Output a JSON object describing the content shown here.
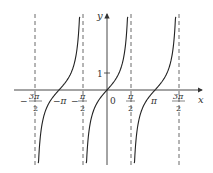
{
  "chart_data": {
    "type": "line",
    "title": "",
    "function": "y = tan x",
    "xlabel": "x",
    "ylabel": "y",
    "x_ticks": [
      {
        "value": -4.712,
        "label_num": "3π",
        "label_den": "2",
        "sign": "−"
      },
      {
        "value": -3.1416,
        "label": "−π"
      },
      {
        "value": -1.5708,
        "label_num": "π",
        "label_den": "2",
        "sign": "−"
      },
      {
        "value": 0,
        "label": "0"
      },
      {
        "value": 1.5708,
        "label_num": "π",
        "label_den": "2",
        "sign": ""
      },
      {
        "value": 3.1416,
        "label": "π"
      },
      {
        "value": 4.712,
        "label_num": "3π",
        "label_den": "2",
        "sign": ""
      }
    ],
    "y_ticks": [
      {
        "value": 1,
        "label": "1"
      }
    ],
    "asymptotes": [
      -4.712,
      -1.5708,
      1.5708,
      4.712
    ],
    "asymptote_style": "dashed",
    "branches": [
      {
        "center": -3.1416,
        "x_range": [
          -4.5,
          -1.78
        ]
      },
      {
        "center": 0,
        "x_range": [
          -1.36,
          1.36
        ]
      },
      {
        "center": 3.1416,
        "x_range": [
          1.78,
          4.5
        ]
      }
    ],
    "xlim": [
      -5.5,
      5.8
    ],
    "ylim": [
      -4.3,
      4.3
    ],
    "grid": false,
    "legend": null
  },
  "labels": {
    "x_axis": "x",
    "y_axis": "y",
    "origin": "0",
    "y_one": "1",
    "neg_pi": "−π",
    "pi": "π",
    "minus": "−",
    "three_pi": "3π",
    "pi_sym": "π",
    "two": "2"
  }
}
